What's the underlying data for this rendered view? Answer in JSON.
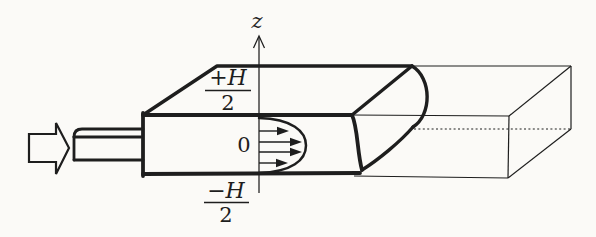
{
  "figure": {
    "labels": {
      "axis": "z",
      "origin": "0",
      "upper_bound_numerator": "+H",
      "upper_bound_denominator": "2",
      "lower_bound_numerator": "−H",
      "lower_bound_denominator": "2"
    },
    "colors": {
      "ink": "#1e1e1e",
      "paper": "#fbfaf7"
    }
  }
}
